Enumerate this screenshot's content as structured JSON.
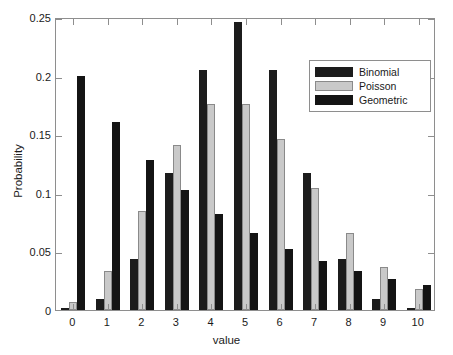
{
  "chart_data": {
    "type": "bar",
    "title": "",
    "xlabel": "value",
    "ylabel": "Probability",
    "categories": [
      "0",
      "1",
      "2",
      "3",
      "4",
      "5",
      "6",
      "7",
      "8",
      "9",
      "10"
    ],
    "xlim": [
      -0.5,
      10.5
    ],
    "ylim": [
      0,
      0.25
    ],
    "yticks": [
      "0",
      "0.05",
      "0.1",
      "0.15",
      "0.2",
      "0.25"
    ],
    "ytick_values": [
      0,
      0.05,
      0.1,
      0.15,
      0.2,
      0.25
    ],
    "grid": false,
    "legend_position": "top-right-inside",
    "series": [
      {
        "name": "Binomial",
        "color": "#1c1c1c",
        "values": [
          0.001,
          0.0098,
          0.0439,
          0.1172,
          0.2051,
          0.2461,
          0.2051,
          0.1172,
          0.0439,
          0.0098,
          0.001
        ]
      },
      {
        "name": "Poisson",
        "color": "#c9c9c9",
        "values": [
          0.0067,
          0.0337,
          0.0842,
          0.1404,
          0.1755,
          0.1755,
          0.1462,
          0.1044,
          0.0653,
          0.0363,
          0.0181
        ]
      },
      {
        "name": "Geometric",
        "color": "#141414",
        "values": [
          0.2,
          0.16,
          0.128,
          0.1024,
          0.0819,
          0.0655,
          0.0524,
          0.0419,
          0.0336,
          0.0268,
          0.0215
        ]
      }
    ]
  },
  "legend": {
    "items": [
      {
        "label": "Binomial"
      },
      {
        "label": "Poisson"
      },
      {
        "label": "Geometric"
      }
    ]
  },
  "axes": {
    "x_title": "value",
    "y_title": "Probability"
  }
}
